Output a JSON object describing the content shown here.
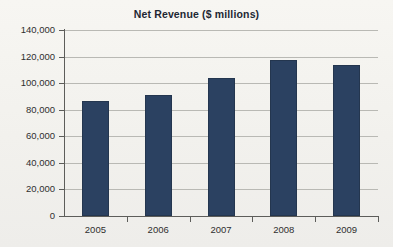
{
  "chart_data": {
    "type": "bar",
    "title": "Net Revenue ($ millions)",
    "xlabel": "",
    "ylabel": "",
    "categories": [
      "2005",
      "2006",
      "2007",
      "2008",
      "2009"
    ],
    "values": [
      86600,
      91000,
      103800,
      117400,
      113600
    ],
    "series": [
      {
        "name": "Net Revenue",
        "values": [
          86600,
          91000,
          103800,
          117400,
          113600
        ]
      }
    ],
    "ylim": [
      0,
      140000
    ],
    "ytick_values": [
      0,
      20000,
      40000,
      60000,
      80000,
      100000,
      120000,
      140000
    ],
    "ytick_labels": [
      "0",
      "20,000",
      "40,000",
      "60,000",
      "80,000",
      "100,000",
      "120,000",
      "140,000"
    ],
    "grid": true,
    "legend": false,
    "legend_position": "none",
    "bar_color": "#2b4161",
    "gridline_color": "#b9b9b4",
    "axis_color": "#5d5d5a",
    "background_color": "#f4f3ef",
    "title_color": "#1d2733"
  }
}
